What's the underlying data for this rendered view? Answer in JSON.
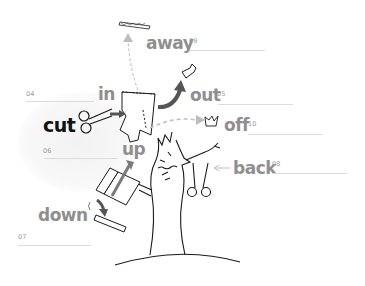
{
  "worksheet": {
    "main_verb": "cut",
    "items": [
      {
        "id": "away",
        "label": "away",
        "number": "09"
      },
      {
        "id": "in",
        "label": "in",
        "number": "04"
      },
      {
        "id": "out",
        "label": "out",
        "number": "05"
      },
      {
        "id": "off",
        "label": "off",
        "number": "10"
      },
      {
        "id": "up",
        "label": "up",
        "number": "06"
      },
      {
        "id": "back",
        "label": "back",
        "number": "08"
      },
      {
        "id": "down",
        "label": "down",
        "number": "07"
      }
    ]
  },
  "colors": {
    "main_verb": "#111111",
    "particle_text": "#8f8f8f",
    "arrow_gray": "#8a8a8a",
    "answer_line": "#dcdcdc",
    "number_text": "#9a9a9a",
    "line_art": "#1a1a1a"
  },
  "icons": [
    "scissors-icon",
    "paper-scrap-icon",
    "tree-icon",
    "arrow-icon",
    "crown-scrap-icon",
    "plank-icon"
  ]
}
